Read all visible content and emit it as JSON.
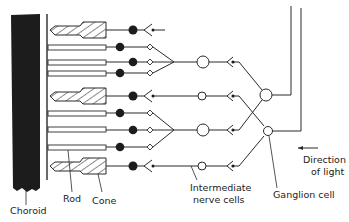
{
  "diagram": {
    "colors": {
      "ink": "#2a2a2a",
      "choroid": "#1c1c1c",
      "background": "#ffffff"
    },
    "labels": {
      "choroid": "Choroid",
      "rod": "Rod",
      "cone": "Cone",
      "intermediate_line1": "Intermediate",
      "intermediate_line2": "nerve cells",
      "ganglion": "Ganglion  cell",
      "direction_line1": "Direction",
      "direction_line2": "of light"
    },
    "layers": [
      "Choroid",
      "Rods and Cones",
      "Intermediate nerve cells",
      "Ganglion cells",
      "Nerve fibres"
    ],
    "receptors": [
      {
        "type": "cone",
        "y": 30
      },
      {
        "type": "rod",
        "y": 47
      },
      {
        "type": "rod",
        "y": 62
      },
      {
        "type": "rod",
        "y": 73
      },
      {
        "type": "cone",
        "y": 96
      },
      {
        "type": "rod",
        "y": 113
      },
      {
        "type": "rod",
        "y": 130
      },
      {
        "type": "rod",
        "y": 147
      },
      {
        "type": "cone",
        "y": 166
      }
    ],
    "light_direction": "right-to-left"
  }
}
